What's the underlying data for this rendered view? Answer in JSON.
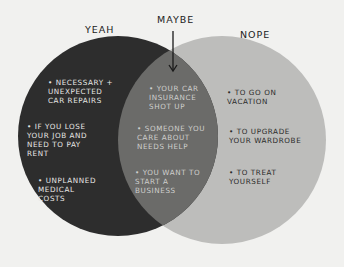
{
  "diagram": {
    "type": "venn",
    "sets": [
      {
        "id": "yeah",
        "label": "YEAH",
        "color": "#2d2d2d",
        "items": [
          "• NECESSARY +\nUNEXPECTED\nCAR REPAIRS",
          "• IF YOU LOSE\nYOUR JOB AND\nNEED TO PAY\nRENT",
          "• UNPLANNED\nMEDICAL\nCOSTS"
        ]
      },
      {
        "id": "nope",
        "label": "NOPE",
        "color": "#bdbdbb",
        "items": [
          "• TO GO ON\nVACATION",
          "• TO UPGRADE\nYOUR WARDROBE",
          "• TO TREAT\nYOURSELF"
        ]
      }
    ],
    "intersection": {
      "label": "MAYBE",
      "color": "#6b6b69",
      "items": [
        "• YOUR CAR\nINSURANCE\nSHOT UP",
        "• SOMEONE YOU\nCARE ABOUT\nNEEDS HELP",
        "• YOU WANT TO\nSTART A\nBUSINESS"
      ]
    }
  }
}
